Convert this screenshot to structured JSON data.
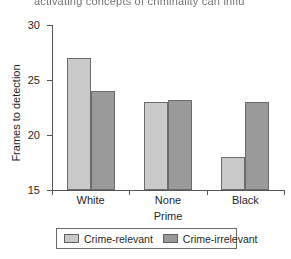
{
  "caption": {
    "truncated_text": "activating concepts of criminality can influ"
  },
  "chart_data": {
    "type": "bar",
    "title": "",
    "xlabel": "Prime",
    "ylabel": "Frames to detection",
    "categories": [
      "White",
      "None",
      "Black"
    ],
    "series": [
      {
        "name": "Crime-relevant",
        "values": [
          27,
          23,
          18
        ],
        "color": "#c9c9c9"
      },
      {
        "name": "Crime-irrelevant",
        "values": [
          24,
          23.2,
          23
        ],
        "color": "#9a9a9a"
      }
    ],
    "ylim": [
      15,
      30
    ],
    "yticks": [
      15,
      20,
      25,
      30
    ],
    "ytick_labels": [
      "15",
      "20",
      "25",
      "30"
    ],
    "grid": false,
    "legend_position": "bottom"
  }
}
